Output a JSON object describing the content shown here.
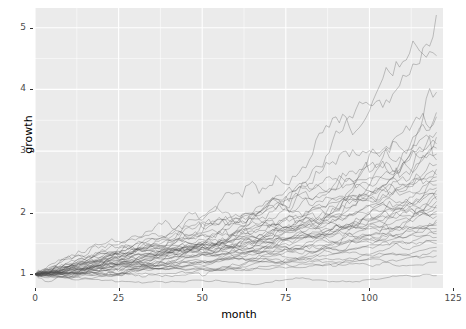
{
  "chart_data": {
    "type": "line",
    "title": "",
    "subtitle": "",
    "xlabel": "month",
    "ylabel": "growth",
    "xlim": [
      0,
      122
    ],
    "ylim": [
      0.78,
      5.32
    ],
    "xticks": [
      0,
      25,
      50,
      75,
      100,
      125
    ],
    "xticklabels": [
      "0",
      "25",
      "50",
      "75",
      "100",
      "125"
    ],
    "yticks": [
      1,
      2,
      3,
      4,
      5
    ],
    "yticklabels": [
      "1",
      "2",
      "3",
      "4",
      "5"
    ],
    "grid": true,
    "grid_color": "#ffffff",
    "panel_background": "#ebebeb",
    "legend": "none",
    "line_color": "#4d4d4d",
    "line_opacity": 0.45,
    "line_width": 0.7,
    "n_series": 42,
    "x_start": 0,
    "x_end": 120,
    "x_step": 1,
    "y_start": 1,
    "series_endpoints": [
      5.2,
      4.55,
      3.95,
      3.62,
      3.55,
      3.3,
      3.22,
      3.12,
      3.05,
      2.95,
      2.86,
      2.78,
      2.7,
      2.62,
      2.58,
      2.52,
      2.45,
      2.4,
      2.36,
      2.3,
      2.26,
      2.22,
      2.18,
      2.12,
      2.08,
      2.02,
      1.98,
      1.94,
      1.88,
      1.84,
      1.8,
      1.74,
      1.7,
      1.66,
      1.6,
      1.55,
      1.5,
      1.44,
      1.38,
      1.3,
      1.2,
      0.98
    ],
    "series_drift": [
      0.0138,
      0.0126,
      0.0115,
      0.0108,
      0.0106,
      0.01,
      0.0098,
      0.0095,
      0.0093,
      0.009,
      0.0088,
      0.0086,
      0.0083,
      0.008,
      0.0079,
      0.0077,
      0.0075,
      0.0073,
      0.0072,
      0.007,
      0.0068,
      0.0067,
      0.0066,
      0.0064,
      0.0062,
      0.006,
      0.0059,
      0.0057,
      0.0055,
      0.0053,
      0.0051,
      0.0049,
      0.0047,
      0.0045,
      0.0042,
      0.0039,
      0.0036,
      0.0032,
      0.0028,
      0.0023,
      0.0016,
      0.0
    ],
    "series_noise": [
      0.03,
      0.029,
      0.028,
      0.026,
      0.026,
      0.025,
      0.025,
      0.024,
      0.024,
      0.023,
      0.023,
      0.022,
      0.022,
      0.022,
      0.021,
      0.021,
      0.021,
      0.02,
      0.02,
      0.02,
      0.019,
      0.019,
      0.019,
      0.019,
      0.018,
      0.018,
      0.018,
      0.018,
      0.017,
      0.017,
      0.017,
      0.016,
      0.016,
      0.016,
      0.015,
      0.015,
      0.015,
      0.014,
      0.014,
      0.013,
      0.012,
      0.011
    ]
  }
}
